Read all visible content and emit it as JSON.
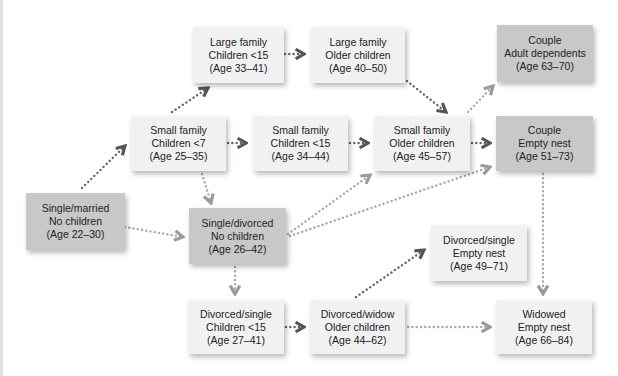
{
  "diagram": {
    "type": "flow",
    "nodes": [
      {
        "id": "large-children-15",
        "line1": "Large family",
        "line2": "Children <15",
        "line3": "(Age 33–41)",
        "shade": "light"
      },
      {
        "id": "large-older",
        "line1": "Large family",
        "line2": "Older children",
        "line3": "(Age 40–50)",
        "shade": "light"
      },
      {
        "id": "couple-adult-dep",
        "line1": "Couple",
        "line2": "Adult dependents",
        "line3": "(Age 63–70)",
        "shade": "dark"
      },
      {
        "id": "small-children-7",
        "line1": "Small family",
        "line2": "Children <7",
        "line3": "(Age 25–35)",
        "shade": "light"
      },
      {
        "id": "small-children-15",
        "line1": "Small family",
        "line2": "Children <15",
        "line3": "(Age 34–44)",
        "shade": "light"
      },
      {
        "id": "small-older",
        "line1": "Small family",
        "line2": "Older children",
        "line3": "(Age 45–57)",
        "shade": "light"
      },
      {
        "id": "couple-empty-nest",
        "line1": "Couple",
        "line2": "Empty nest",
        "line3": "(Age 51–73)",
        "shade": "dark"
      },
      {
        "id": "single-married",
        "line1": "Single/married",
        "line2": "No children",
        "line3": "(Age 22–30)",
        "shade": "dark"
      },
      {
        "id": "single-divorced",
        "line1": "Single/divorced",
        "line2": "No children",
        "line3": "(Age 26–42)",
        "shade": "dark"
      },
      {
        "id": "divorced-empty-nest",
        "line1": "Divorced/single",
        "line2": "Empty nest",
        "line3": "(Age 49–71)",
        "shade": "light"
      },
      {
        "id": "divorced-children-15",
        "line1": "Divorced/single",
        "line2": "Children <15",
        "line3": "(Age 27–41)",
        "shade": "light"
      },
      {
        "id": "divorced-widow-older",
        "line1": "Divorced/widow",
        "line2": "Older children",
        "line3": "(Age 44–62)",
        "shade": "light"
      },
      {
        "id": "widowed-empty-nest",
        "line1": "Widowed",
        "line2": "Empty nest",
        "line3": "(Age 66–84)",
        "shade": "light"
      }
    ],
    "edges": [
      {
        "from": "single-married",
        "to": "small-children-7",
        "style": "dark-dotted"
      },
      {
        "from": "single-married",
        "to": "single-divorced",
        "style": "light-dotted"
      },
      {
        "from": "small-children-7",
        "to": "large-children-15",
        "style": "dark-dotted"
      },
      {
        "from": "small-children-7",
        "to": "small-children-15",
        "style": "dark-dotted"
      },
      {
        "from": "small-children-7",
        "to": "single-divorced",
        "style": "light-dotted"
      },
      {
        "from": "large-children-15",
        "to": "large-older",
        "style": "dark-dotted"
      },
      {
        "from": "large-older",
        "to": "small-older",
        "style": "dark-dotted"
      },
      {
        "from": "small-children-15",
        "to": "small-older",
        "style": "dark-dotted"
      },
      {
        "from": "small-older",
        "to": "couple-adult-dep",
        "style": "light-dotted"
      },
      {
        "from": "small-older",
        "to": "couple-empty-nest",
        "style": "dark-dotted"
      },
      {
        "from": "single-divorced",
        "to": "small-older",
        "style": "light-dotted"
      },
      {
        "from": "single-divorced",
        "to": "couple-empty-nest",
        "style": "light-dotted"
      },
      {
        "from": "single-divorced",
        "to": "divorced-children-15",
        "style": "light-dotted"
      },
      {
        "from": "divorced-children-15",
        "to": "divorced-widow-older",
        "style": "dark-dotted"
      },
      {
        "from": "divorced-widow-older",
        "to": "divorced-empty-nest",
        "style": "dark-dotted"
      },
      {
        "from": "divorced-widow-older",
        "to": "widowed-empty-nest",
        "style": "light-dotted"
      },
      {
        "from": "couple-empty-nest",
        "to": "widowed-empty-nest",
        "style": "light-dotted"
      }
    ],
    "colors": {
      "node_light": "#f1f1f1",
      "node_dark": "#c8c8c8",
      "edge_dark": "#666666",
      "edge_light": "#a8a8a8"
    }
  }
}
